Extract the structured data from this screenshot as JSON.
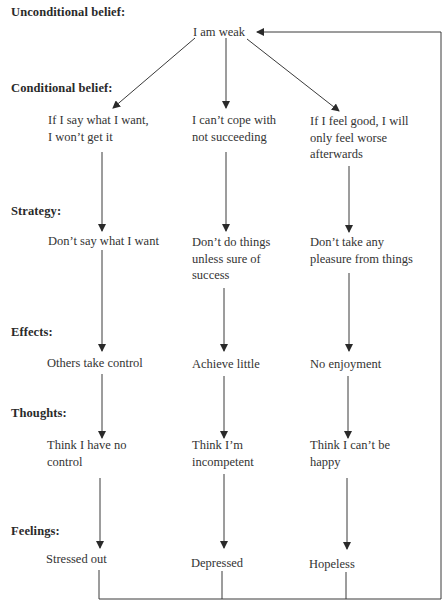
{
  "diagram": {
    "sections": [
      {
        "id": "unconditional",
        "label": "Unconditional belief:"
      },
      {
        "id": "conditional",
        "label": "Conditional belief:"
      },
      {
        "id": "strategy",
        "label": "Strategy:"
      },
      {
        "id": "effects",
        "label": "Effects:"
      },
      {
        "id": "thoughts",
        "label": "Thoughts:"
      },
      {
        "id": "feelings",
        "label": "Feelings:"
      }
    ],
    "root": {
      "text": "I am weak"
    },
    "columns": [
      {
        "conditional": [
          "If I say what I want,",
          "I won’t get it"
        ],
        "strategy": [
          "Don’t say what I want"
        ],
        "effects": [
          "Others take control"
        ],
        "thoughts": [
          "Think I have no",
          "control"
        ],
        "feelings": [
          "Stressed out"
        ]
      },
      {
        "conditional": [
          "I can’t cope with",
          "not succeeding"
        ],
        "strategy": [
          "Don’t do things",
          "unless sure of",
          "success"
        ],
        "effects": [
          "Achieve little"
        ],
        "thoughts": [
          "Think I’m",
          "incompetent"
        ],
        "feelings": [
          "Depressed"
        ]
      },
      {
        "conditional": [
          "If I feel good, I will",
          "only feel worse",
          "afterwards"
        ],
        "strategy": [
          "Don’t take any",
          "pleasure from things"
        ],
        "effects": [
          "No enjoyment"
        ],
        "thoughts": [
          "Think I can’t be",
          "happy"
        ],
        "feelings": [
          "Hopeless"
        ]
      }
    ],
    "feedback_loop": {
      "from": "feelings (all columns)",
      "to": "I am weak"
    },
    "colors": {
      "line": "#3a3a3a",
      "text": "#2a2a2a",
      "background": "#ffffff"
    }
  }
}
